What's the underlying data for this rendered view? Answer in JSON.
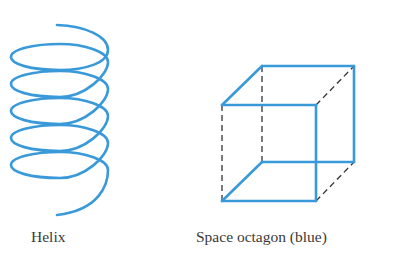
{
  "figures": [
    {
      "id": "helix",
      "label": "Helix",
      "color": "#3a9ad9"
    },
    {
      "id": "cube",
      "label": "Space octagon (blue)",
      "color": "#3a9ad9",
      "hidden_edge_color": "#333333"
    }
  ]
}
